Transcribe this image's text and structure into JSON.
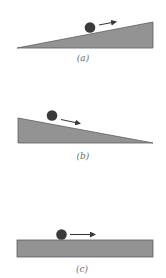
{
  "figure": {
    "colors": {
      "surface_fill": "#939393",
      "surface_stroke": "#5e5e5e",
      "ball": "#3a3a3a",
      "arrow": "#3a3a3a",
      "label": "#6a6a6a",
      "background": "#ffffff"
    },
    "panels": [
      {
        "id": "a",
        "label": "(a)",
        "surface": "incline rising to the right",
        "ball_motion": "right (up the incline)"
      },
      {
        "id": "b",
        "label": "(b)",
        "surface": "incline falling to the right",
        "ball_motion": "right (down the incline)"
      },
      {
        "id": "c",
        "label": "(c)",
        "surface": "horizontal flat surface",
        "ball_motion": "right (along the level)"
      }
    ]
  }
}
